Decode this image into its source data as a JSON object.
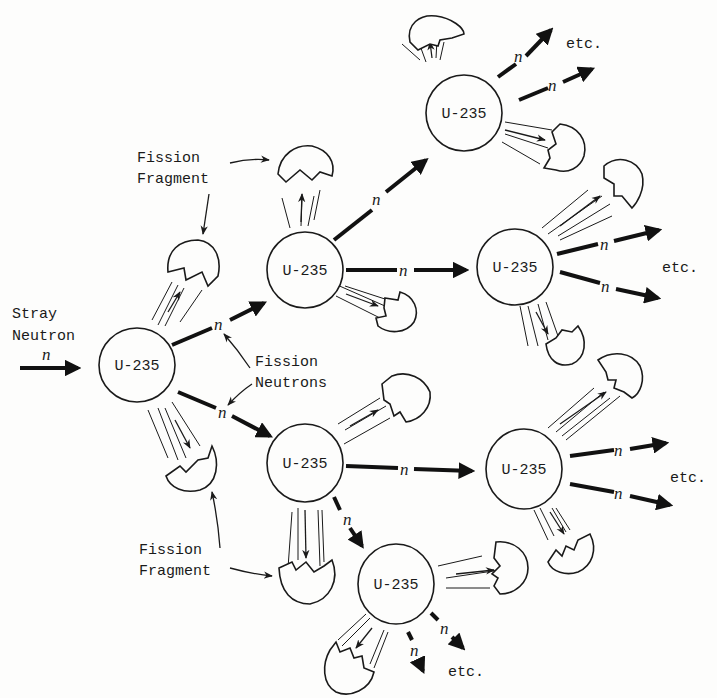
{
  "diagram": {
    "nucleus_label": "U-235",
    "neutron_symbol": "n",
    "labels": {
      "stray_neutron_line1": "Stray",
      "stray_neutron_line2": "Neutron",
      "fission_fragment_top_line1": "Fission",
      "fission_fragment_top_line2": "Fragment",
      "fission_neutrons_line1": "Fission",
      "fission_neutrons_line2": "Neutrons",
      "fission_fragment_bottom_line1": "Fission",
      "fission_fragment_bottom_line2": "Fragment",
      "etc": "etc."
    },
    "nuclei": [
      {
        "id": "gen1",
        "label": "U-235",
        "x": 137,
        "y": 365
      },
      {
        "id": "gen2-top",
        "label": "U-235",
        "x": 305,
        "y": 270
      },
      {
        "id": "gen2-bottom",
        "label": "U-235",
        "x": 305,
        "y": 463
      },
      {
        "id": "gen3-top",
        "label": "U-235",
        "x": 464,
        "y": 113
      },
      {
        "id": "gen3-mid",
        "label": "U-235",
        "x": 515,
        "y": 267
      },
      {
        "id": "gen3-lower",
        "label": "U-235",
        "x": 524,
        "y": 469
      },
      {
        "id": "gen3-bottom",
        "label": "U-235",
        "x": 396,
        "y": 584
      }
    ],
    "etc_labels": [
      {
        "x": 540,
        "y": 44
      },
      {
        "x": 662,
        "y": 271
      },
      {
        "x": 670,
        "y": 482
      },
      {
        "x": 448,
        "y": 676
      }
    ],
    "colors": {
      "ink": "#1a1a1a",
      "paper": "#fdfdfc"
    }
  }
}
